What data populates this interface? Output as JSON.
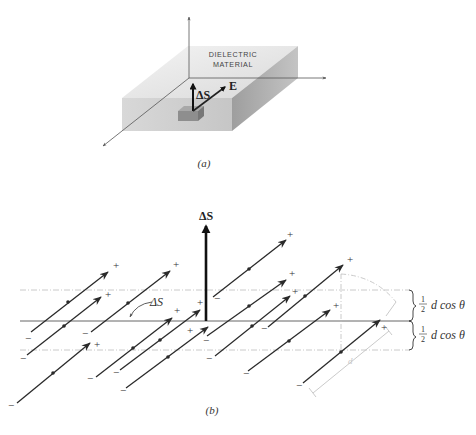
{
  "figure": {
    "part_a": {
      "caption": "(a)",
      "slab_label_line1": "DIELECTRIC",
      "slab_label_line2": "MATERIAL",
      "delta_s_label": "ΔS",
      "e_label": "E"
    },
    "part_b": {
      "caption": "(b)",
      "delta_s_vector_label": "ΔS",
      "delta_s_surface_label": "ΔS",
      "dimension_upper": {
        "fraction_num": "1",
        "fraction_den": "2",
        "text": "d cos θ"
      },
      "dimension_lower": {
        "fraction_num": "1",
        "fraction_den": "2",
        "text": "d cos θ"
      },
      "length_label": "d",
      "plus_sign": "+",
      "minus_sign": "−",
      "dipole_count": 14
    },
    "colors": {
      "ink": "#2a2a2a",
      "faint": "#b8b8b8",
      "slab_top": "#e2e2e2",
      "slab_front": "#cfcfcf",
      "slab_side": "#a9a9a9"
    }
  }
}
